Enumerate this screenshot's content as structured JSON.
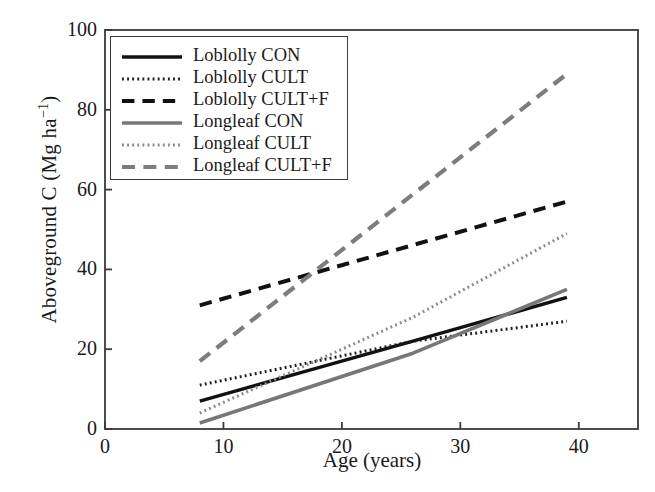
{
  "chart_data": {
    "type": "line",
    "title": "",
    "xlabel": "Age (years)",
    "ylabel": "Aboveground C (Mg ha−1)",
    "ylabel_main": "Aboveground C (Mg ha",
    "ylabel_exp": "−1",
    "ylabel_tail": ")",
    "xlim": [
      0,
      45
    ],
    "ylim": [
      0,
      100
    ],
    "xticks": [
      0,
      10,
      20,
      30,
      40
    ],
    "xtick_labels": [
      "0",
      "10",
      "20",
      "30",
      "40"
    ],
    "yticks": [
      0,
      20,
      40,
      60,
      80,
      100
    ],
    "ytick_labels": [
      "0",
      "20",
      "40",
      "60",
      "80",
      "100"
    ],
    "grid": false,
    "legend_position": "upper-left-inside",
    "series": [
      {
        "name": "Loblolly CON",
        "color": "#111111",
        "style": "solid",
        "width": 3.4,
        "x": [
          8,
          26,
          39
        ],
        "y": [
          7,
          22,
          33
        ]
      },
      {
        "name": "Loblolly CULT",
        "color": "#1c1c1c",
        "style": "dotted",
        "width": 3.0,
        "x": [
          8,
          26,
          39
        ],
        "y": [
          11,
          22,
          27
        ]
      },
      {
        "name": "Loblolly CULT+F",
        "color": "#111111",
        "style": "dashed",
        "width": 4.0,
        "x": [
          8,
          39
        ],
        "y": [
          31,
          57
        ]
      },
      {
        "name": "Longleaf CON",
        "color": "#777777",
        "style": "solid",
        "width": 3.6,
        "x": [
          8,
          26,
          39
        ],
        "y": [
          1.5,
          19,
          35
        ]
      },
      {
        "name": "Longleaf CULT",
        "color": "#8a8a8a",
        "style": "dotted",
        "width": 3.0,
        "x": [
          8,
          26,
          39
        ],
        "y": [
          4,
          28,
          49
        ]
      },
      {
        "name": "Longleaf CULT+F",
        "color": "#7d7d7d",
        "style": "dashed",
        "width": 4.2,
        "x": [
          8,
          39
        ],
        "y": [
          17,
          89
        ]
      }
    ]
  },
  "axes": {
    "frame_color": "#3a3a3a"
  }
}
